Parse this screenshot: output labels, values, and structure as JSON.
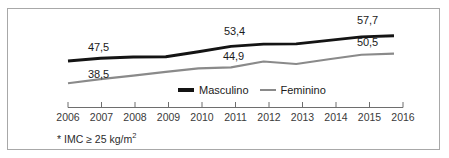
{
  "chart_data": {
    "type": "line",
    "title": "",
    "subtitle": "",
    "xlabel": "",
    "ylabel": "",
    "grid": false,
    "legend_position": "bottom-center",
    "categories": [
      "2006",
      "2007",
      "2008",
      "2009",
      "2010",
      "2011",
      "2012",
      "2013",
      "2014",
      "2015",
      "2016"
    ],
    "xlim": [
      "2006",
      "2016"
    ],
    "ylim": [
      35,
      60
    ],
    "series": [
      {
        "name": "Masculino",
        "color": "#141414",
        "values": [
          47.5,
          48.6,
          49.1,
          49.2,
          51.2,
          53.4,
          54.3,
          54.4,
          55.8,
          57.2,
          57.7
        ],
        "labeled_points": [
          {
            "category": "2006",
            "value": 47.5,
            "label": "47,5"
          },
          {
            "category": "2011",
            "value": 53.4,
            "label": "53,4"
          },
          {
            "category": "2016",
            "value": 57.7,
            "label": "57,7"
          }
        ]
      },
      {
        "name": "Feminino",
        "color": "#8a8a8a",
        "values": [
          38.5,
          40.2,
          41.6,
          43.1,
          44.5,
          44.9,
          47.3,
          46.3,
          48.2,
          50.0,
          50.5
        ],
        "labeled_points": [
          {
            "category": "2006",
            "value": 38.5,
            "label": "38,5"
          },
          {
            "category": "2011",
            "value": 44.9,
            "label": "44,9"
          },
          {
            "category": "2016",
            "value": 50.5,
            "label": "50,5"
          }
        ]
      }
    ],
    "annotations": [
      "* IMC ≥ 25 kg/m²"
    ]
  },
  "value_labels": {
    "male_start": "47,5",
    "male_mid": "53,4",
    "male_end": "57,7",
    "female_start": "38,5",
    "female_mid": "44,9",
    "female_end": "50,5"
  },
  "axis": {
    "tick_labels": [
      "2006",
      "2007",
      "2008",
      "2009",
      "2010",
      "2011",
      "2012",
      "2013",
      "2014",
      "2015",
      "2016"
    ]
  },
  "legend": {
    "items": [
      {
        "label": "Masculino",
        "color": "#141414"
      },
      {
        "label": "Feminino",
        "color": "#8a8a8a"
      }
    ]
  },
  "footnote": {
    "text": "* IMC ≥ 25 kg/m",
    "exponent": "2"
  },
  "colors": {
    "male_line": "#141414",
    "female_line": "#8a8a8a",
    "frame_border": "#a8a8a8",
    "axis": "#6e6e6e",
    "background": "#ffffff",
    "text": "#1b1b1b"
  }
}
